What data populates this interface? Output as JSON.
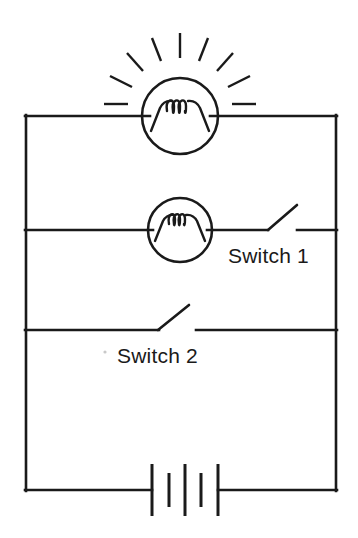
{
  "diagram": {
    "type": "electrical-circuit-schematic",
    "background_color": "#ffffff",
    "line_color": "#1a1a1a",
    "labels": {
      "switch_1": "Switch 1",
      "switch_2": "Switch 2"
    },
    "components": {
      "lamp_lit": {
        "name": "lamp-lit",
        "state": "on",
        "center_x": 180,
        "center_y": 116,
        "radius": 38,
        "filament_coils": 3,
        "ray_count": 9,
        "branch": "top-rail"
      },
      "lamp_unlit": {
        "name": "lamp-unlit",
        "state": "off",
        "center_x": 180,
        "center_y": 230,
        "radius": 32,
        "filament_coils": 3,
        "ray_count": 0,
        "branch": "middle-branch"
      },
      "switch_1": {
        "name": "switch-1",
        "state": "open",
        "pivot_x": 268,
        "pivot_y": 230,
        "contact_x": 298,
        "lever_tip_x": 296,
        "lever_tip_y": 206,
        "branch": "middle-branch"
      },
      "switch_2": {
        "name": "switch-2",
        "state": "open",
        "pivot_x": 158,
        "pivot_y": 330,
        "contact_x": 196,
        "lever_tip_x": 188,
        "lever_tip_y": 306,
        "branch": "lower-branch"
      },
      "battery": {
        "name": "battery",
        "plate_count": 5,
        "center_x": 185,
        "center_y": 490,
        "plate_pattern": "long-short-long-short-long",
        "branch": "bottom-rail"
      }
    },
    "frame": {
      "left_x": 25,
      "right_x": 337,
      "top_y": 116,
      "bottom_y": 490,
      "middle_branch_y": 230,
      "lower_branch_y": 330
    }
  }
}
